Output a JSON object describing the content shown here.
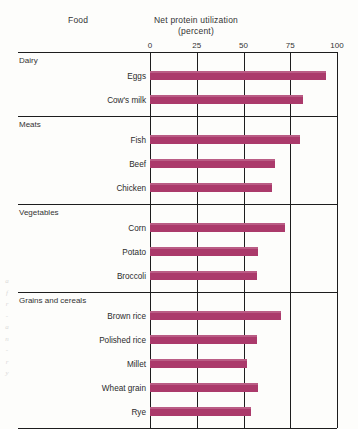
{
  "headers": {
    "food": "Food",
    "axis_title_line1": "Net protein utilization",
    "axis_title_line2": "(percent)"
  },
  "colors": {
    "bar": "#ab3a6b",
    "rule": "#1d1d1d",
    "background": "#fdfdfb",
    "text": "#2a2a2a"
  },
  "margin_bleed": [
    "a",
    "f",
    "r",
    "-",
    "a",
    "n",
    "-",
    "r",
    "y"
  ],
  "chart_data": {
    "type": "bar",
    "orientation": "horizontal",
    "title": "Net protein utilization (percent)",
    "xlabel": "Net protein utilization (percent)",
    "ylabel": "Food",
    "xlim": [
      0,
      100
    ],
    "ticks": [
      0,
      25,
      50,
      75,
      100
    ],
    "tick_labels": [
      "0",
      "25",
      "50",
      "75",
      "100"
    ],
    "grid": true,
    "legend": false,
    "groups": [
      {
        "name": "Dairy",
        "categories": [
          "Eggs",
          "Cow's milk"
        ],
        "values": [
          94,
          82
        ]
      },
      {
        "name": "Meats",
        "categories": [
          "Fish",
          "Beef",
          "Chicken"
        ],
        "values": [
          80,
          67,
          65
        ]
      },
      {
        "name": "Vegetables",
        "categories": [
          "Corn",
          "Potato",
          "Broccoli"
        ],
        "values": [
          72,
          58,
          57
        ]
      },
      {
        "name": "Grains and cereals",
        "categories": [
          "Brown rice",
          "Polished rice",
          "Millet",
          "Wheat grain",
          "Rye"
        ],
        "values": [
          70,
          57,
          52,
          58,
          54
        ]
      }
    ],
    "categories": [
      "Eggs",
      "Cow's milk",
      "Fish",
      "Beef",
      "Chicken",
      "Corn",
      "Potato",
      "Broccoli",
      "Brown rice",
      "Polished rice",
      "Millet",
      "Wheat grain",
      "Rye"
    ],
    "values": [
      94,
      82,
      80,
      67,
      65,
      72,
      58,
      57,
      70,
      57,
      52,
      58,
      54
    ]
  }
}
